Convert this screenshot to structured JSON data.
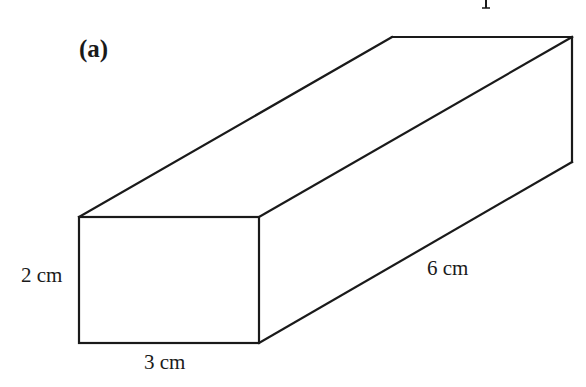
{
  "figure": {
    "part_label": "(a)",
    "shape": "cuboid",
    "dimensions": {
      "height": "2 cm",
      "width": "3 cm",
      "length": "6 cm"
    },
    "stroke_color": "#1a1a1a",
    "background": "#ffffff"
  }
}
